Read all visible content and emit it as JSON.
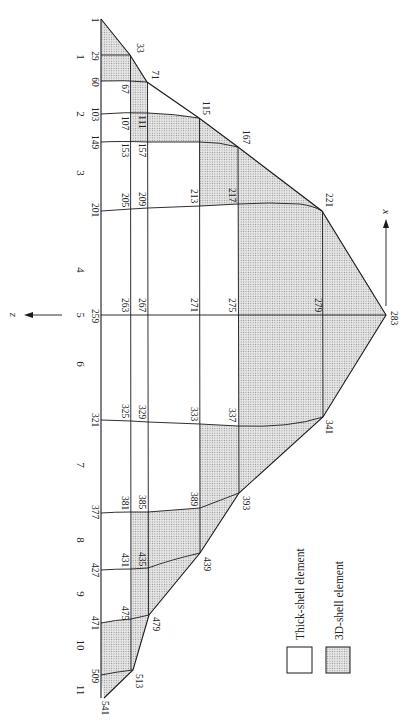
{
  "figure": {
    "colors": {
      "line": "#1a1a1a",
      "shade_bg": "#e4e4e4",
      "shade_dot": "#8a8a8a",
      "paper": "#ffffff"
    },
    "axes": {
      "z_label": "z",
      "x_label": "x"
    },
    "legend": [
      {
        "label": "Thick-shell element",
        "style": "white"
      },
      {
        "label": "3D-shell element",
        "style": "shaded"
      }
    ],
    "section_numbers": [
      {
        "n": "1",
        "y": 57
      },
      {
        "n": "2",
        "y": 114
      },
      {
        "n": "3",
        "y": 173
      },
      {
        "n": "4",
        "y": 270
      },
      {
        "n": "5",
        "y": 315
      },
      {
        "n": "6",
        "y": 364
      },
      {
        "n": "7",
        "y": 465
      },
      {
        "n": "8",
        "y": 540
      },
      {
        "n": "9",
        "y": 594
      },
      {
        "n": "10",
        "y": 645
      },
      {
        "n": "11",
        "y": 690
      }
    ],
    "node_labels": [
      {
        "id": "1",
        "x": 94,
        "y": 20
      },
      {
        "id": "29",
        "x": 94,
        "y": 56
      },
      {
        "id": "33",
        "x": 139,
        "y": 48
      },
      {
        "id": "60",
        "x": 94,
        "y": 82
      },
      {
        "id": "67",
        "x": 124,
        "y": 89
      },
      {
        "id": "71",
        "x": 154,
        "y": 75
      },
      {
        "id": "103",
        "x": 94,
        "y": 114
      },
      {
        "id": "107",
        "x": 124,
        "y": 123
      },
      {
        "id": "111",
        "x": 141,
        "y": 122
      },
      {
        "id": "115",
        "x": 205,
        "y": 108
      },
      {
        "id": "149",
        "x": 94,
        "y": 142
      },
      {
        "id": "153",
        "x": 124,
        "y": 150
      },
      {
        "id": "157",
        "x": 141,
        "y": 150
      },
      {
        "id": "167",
        "x": 245,
        "y": 137
      },
      {
        "id": "201",
        "x": 94,
        "y": 210
      },
      {
        "id": "205",
        "x": 124,
        "y": 200
      },
      {
        "id": "209",
        "x": 141,
        "y": 199
      },
      {
        "id": "213",
        "x": 193,
        "y": 196
      },
      {
        "id": "217",
        "x": 231,
        "y": 195
      },
      {
        "id": "221",
        "x": 328,
        "y": 200
      },
      {
        "id": "259",
        "x": 94,
        "y": 316
      },
      {
        "id": "263",
        "x": 124,
        "y": 305
      },
      {
        "id": "267",
        "x": 141,
        "y": 305
      },
      {
        "id": "271",
        "x": 193,
        "y": 305
      },
      {
        "id": "275",
        "x": 231,
        "y": 305
      },
      {
        "id": "279",
        "x": 317,
        "y": 305
      },
      {
        "id": "283",
        "x": 393,
        "y": 318
      },
      {
        "id": "321",
        "x": 94,
        "y": 420
      },
      {
        "id": "325",
        "x": 124,
        "y": 411
      },
      {
        "id": "329",
        "x": 141,
        "y": 412
      },
      {
        "id": "333",
        "x": 193,
        "y": 414
      },
      {
        "id": "337",
        "x": 231,
        "y": 415
      },
      {
        "id": "341",
        "x": 328,
        "y": 427
      },
      {
        "id": "377",
        "x": 94,
        "y": 512
      },
      {
        "id": "381",
        "x": 124,
        "y": 503
      },
      {
        "id": "385",
        "x": 141,
        "y": 502
      },
      {
        "id": "389",
        "x": 193,
        "y": 499
      },
      {
        "id": "393",
        "x": 245,
        "y": 503
      },
      {
        "id": "427",
        "x": 94,
        "y": 570
      },
      {
        "id": "431",
        "x": 124,
        "y": 560
      },
      {
        "id": "435",
        "x": 141,
        "y": 559
      },
      {
        "id": "439",
        "x": 206,
        "y": 564
      },
      {
        "id": "471",
        "x": 94,
        "y": 623
      },
      {
        "id": "475",
        "x": 124,
        "y": 613
      },
      {
        "id": "479",
        "x": 155,
        "y": 624
      },
      {
        "id": "509",
        "x": 94,
        "y": 676
      },
      {
        "id": "513",
        "x": 138,
        "y": 681
      },
      {
        "id": "541",
        "x": 104,
        "y": 708
      }
    ]
  }
}
